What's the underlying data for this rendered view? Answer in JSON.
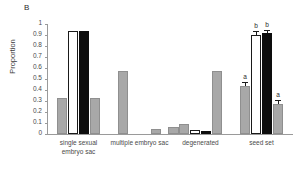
{
  "panel": {
    "label": "B"
  },
  "axes": {
    "ylabel": "Proportion",
    "xlabel": "",
    "yticks": [
      "0",
      "0.1",
      "0.2",
      "0.3",
      "0.4",
      "0.5",
      "0.6",
      "0.7",
      "0.8",
      "0.9",
      "1"
    ]
  },
  "colors": {
    "gray": "#a8a8a8",
    "white": "#ffffff",
    "black": "#0d0d0d",
    "axis": "#9a9a9a",
    "text": "#4a4a4a"
  },
  "chart_data": {
    "type": "bar",
    "title": "",
    "xlabel": "",
    "ylabel": "Proportion",
    "ylim": [
      0,
      1
    ],
    "yticks": [
      0,
      0.1,
      0.2,
      0.3,
      0.4,
      0.5,
      0.6,
      0.7,
      0.8,
      0.9,
      1
    ],
    "grid": false,
    "legend": "none",
    "categories": [
      "single sexual\nembryo sac",
      "multiple embryo sac",
      "degenerated",
      "seed set"
    ],
    "series": [
      {
        "name": "series-1",
        "fill": "gray",
        "values": [
          0.33,
          0.57,
          0.09,
          0.44
        ],
        "errors": [
          0,
          0,
          0,
          0.035
        ],
        "sig": [
          "",
          "",
          "",
          "a"
        ]
      },
      {
        "name": "series-2",
        "fill": "white",
        "values": [
          0.94,
          0.0,
          0.04,
          0.9
        ],
        "errors": [
          0,
          0,
          0,
          0.035
        ],
        "sig": [
          "",
          "",
          "",
          "b"
        ]
      },
      {
        "name": "series-3",
        "fill": "black",
        "values": [
          0.94,
          0.0,
          0.03,
          0.92
        ],
        "errors": [
          0,
          0,
          0,
          0.03
        ],
        "sig": [
          "",
          "",
          "",
          "b"
        ]
      },
      {
        "name": "series-4",
        "fill": "gray",
        "values": [
          0.33,
          0.05,
          0.57,
          0.27
        ],
        "errors": [
          0,
          0,
          0,
          0.04
        ],
        "sig": [
          "",
          "",
          "",
          "a"
        ]
      }
    ],
    "extra_bars": [
      {
        "group": 1,
        "fill": "gray",
        "value": 0.065,
        "note": "small gray bar right of group 2"
      }
    ]
  }
}
